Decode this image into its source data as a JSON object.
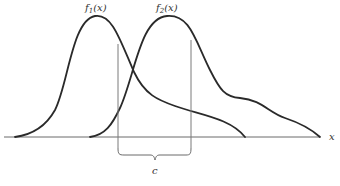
{
  "diagram": {
    "type": "overlapping-distributions",
    "curves": [
      {
        "name": "f1",
        "label": "f",
        "subscript": "1",
        "arg": "(x)"
      },
      {
        "name": "f2",
        "label": "f",
        "subscript": "2",
        "arg": "(x)"
      }
    ],
    "axis": {
      "label": "x"
    },
    "interval": {
      "label": "c"
    },
    "colors": {
      "curve": "#2a2a2a",
      "axis": "#6a6a6a",
      "background": "#ffffff"
    }
  }
}
